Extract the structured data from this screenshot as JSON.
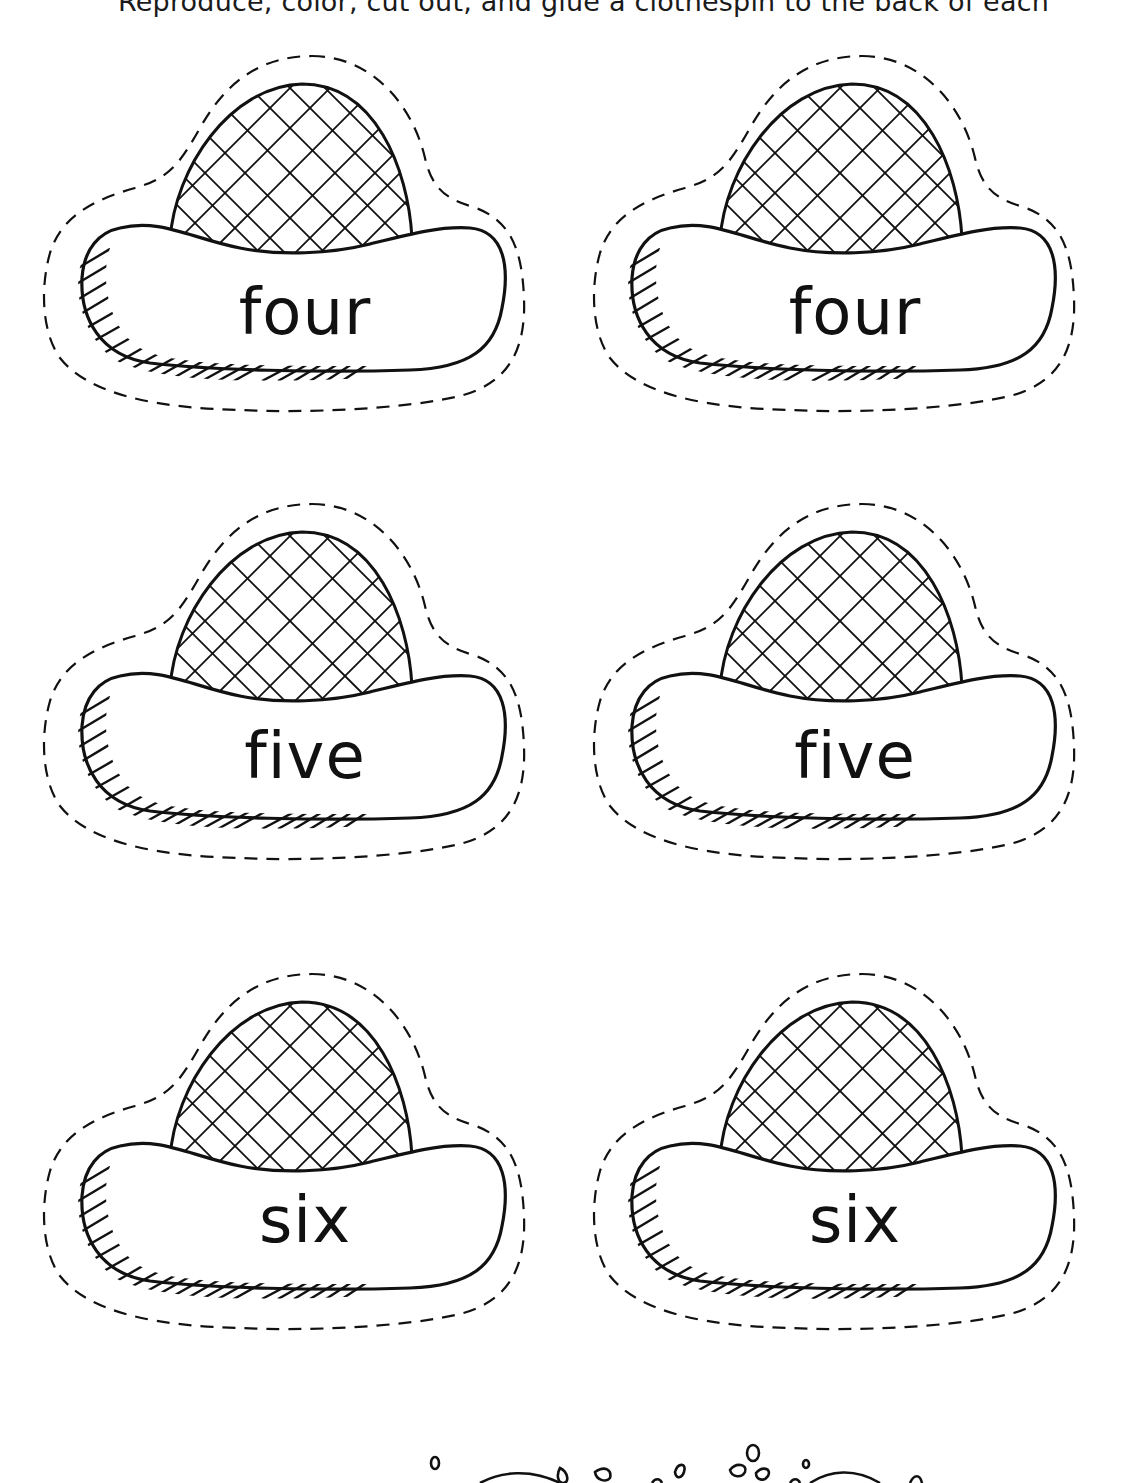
{
  "instructions": "Reproduce, color, cut out, and glue a clothespin to the back of each",
  "cards": [
    {
      "word": "four",
      "row": 1,
      "column": 1
    },
    {
      "word": "four",
      "row": 1,
      "column": 2
    },
    {
      "word": "five",
      "row": 2,
      "column": 1
    },
    {
      "word": "five",
      "row": 2,
      "column": 2
    },
    {
      "word": "six",
      "row": 3,
      "column": 1
    },
    {
      "word": "six",
      "row": 3,
      "column": 2
    }
  ],
  "colors": {
    "ink": "#111111",
    "paper": "#ffffff"
  },
  "icons": {
    "card_art": "sombrero-hat-icon",
    "cut_line": "dashed-cut-line",
    "decoration": "splash-border-icon"
  }
}
